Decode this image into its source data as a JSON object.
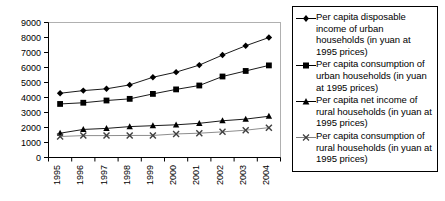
{
  "chart_data": {
    "type": "line",
    "title": "",
    "xlabel": "",
    "ylabel": "",
    "x": [
      "1995",
      "1996",
      "1997",
      "1998",
      "1999",
      "2000",
      "2001",
      "2002",
      "2003",
      "2004"
    ],
    "ylim": [
      0,
      9000
    ],
    "ytick_step": 1000,
    "yticks": [
      "0",
      "1000",
      "2000",
      "3000",
      "4000",
      "5000",
      "6000",
      "7000",
      "8000",
      "9000"
    ],
    "grid": false,
    "legend_position": "right",
    "series": [
      {
        "name": "Per capita disposable income of urban households (in yuan at 1995 prices)",
        "marker": "diamond",
        "color": "#000000",
        "values": [
          4283,
          4460,
          4580,
          4840,
          5350,
          5690,
          6160,
          6830,
          7450,
          8000
        ]
      },
      {
        "name": "Per capita consumption of urban households (in yuan at 1995 prices)",
        "marker": "square",
        "color": "#000000",
        "values": [
          3570,
          3650,
          3800,
          3910,
          4240,
          4540,
          4800,
          5400,
          5770,
          6140
        ]
      },
      {
        "name": "Per capita net income of rural households (in yuan at 1995 prices)",
        "marker": "triangle",
        "color": "#000000",
        "values": [
          1620,
          1870,
          1940,
          2060,
          2120,
          2180,
          2280,
          2450,
          2560,
          2750
        ]
      },
      {
        "name": "Per capita consumption of rural households (in yuan at 1995 prices)",
        "marker": "cross",
        "color": "#808080",
        "values": [
          1400,
          1460,
          1460,
          1470,
          1470,
          1570,
          1620,
          1710,
          1820,
          1990
        ]
      }
    ]
  },
  "legend": {
    "entries": [
      {
        "label": "Per capita disposable income of urban households (in yuan at 1995 prices)",
        "marker": "diamond"
      },
      {
        "label": "Per capita consumption of urban households (in yuan at 1995 prices)",
        "marker": "square"
      },
      {
        "label": "Per capita net income of rural households (in yuan at 1995 prices)",
        "marker": "triangle"
      },
      {
        "label": "Per capita consumption of rural households (in yuan at 1995 prices)",
        "marker": "cross"
      }
    ]
  }
}
